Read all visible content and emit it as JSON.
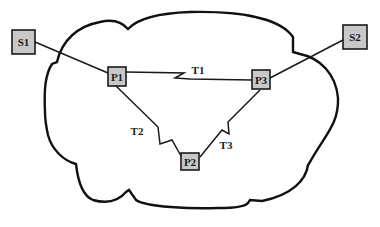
{
  "diagram": {
    "type": "network-topology",
    "cloud": {
      "label": "",
      "stroke": "#111111"
    },
    "nodes": [
      {
        "id": "S1",
        "label": "S1",
        "kind": "site",
        "x": 23,
        "y": 42
      },
      {
        "id": "S2",
        "label": "S2",
        "kind": "site",
        "x": 355,
        "y": 37
      },
      {
        "id": "P1",
        "label": "P1",
        "kind": "pe",
        "x": 117,
        "y": 76
      },
      {
        "id": "P2",
        "label": "P2",
        "kind": "pe",
        "x": 190,
        "y": 162
      },
      {
        "id": "P3",
        "label": "P3",
        "kind": "pe",
        "x": 261,
        "y": 79
      }
    ],
    "links": [
      {
        "from": "S1",
        "to": "P1",
        "label": ""
      },
      {
        "from": "S2",
        "to": "P3",
        "label": ""
      },
      {
        "from": "P1",
        "to": "P3",
        "label": "T1",
        "style": "tunnel"
      },
      {
        "from": "P1",
        "to": "P2",
        "label": "T2",
        "style": "tunnel"
      },
      {
        "from": "P3",
        "to": "P2",
        "label": "T3",
        "style": "tunnel"
      }
    ],
    "colors": {
      "node_fill": "#c8c8c8",
      "stroke": "#1a1a1a",
      "background": "#ffffff"
    }
  }
}
